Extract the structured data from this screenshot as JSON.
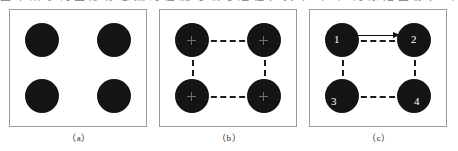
{
  "top_text_strip": {
    "cropped_line": "图 中 所 示 的 圆 形 标 志 点 的 检 测 与 编 号 过 程 ， 其 中 （ a ） 为 原 始 图 像 ， （ b ） 为 连 线 结 果 ， （ c ） 为 编 号 结 果"
  },
  "figure": {
    "panels": [
      {
        "id": "a",
        "caption": "（a）",
        "nodes": [
          {
            "position": "top-left",
            "label": ""
          },
          {
            "position": "top-right",
            "label": ""
          },
          {
            "position": "bottom-left",
            "label": ""
          },
          {
            "position": "bottom-right",
            "label": ""
          }
        ],
        "has_connectors": false,
        "has_center_marks": false,
        "has_arrow": false
      },
      {
        "id": "b",
        "caption": "（b）",
        "nodes": [
          {
            "position": "top-left",
            "label": ""
          },
          {
            "position": "top-right",
            "label": ""
          },
          {
            "position": "bottom-left",
            "label": ""
          },
          {
            "position": "bottom-right",
            "label": ""
          }
        ],
        "has_connectors": true,
        "has_center_marks": true,
        "has_arrow": false
      },
      {
        "id": "c",
        "caption": "（c）",
        "nodes": [
          {
            "position": "top-left",
            "label": "1"
          },
          {
            "position": "top-right",
            "label": "2"
          },
          {
            "position": "bottom-left",
            "label": "3"
          },
          {
            "position": "bottom-right",
            "label": "4"
          }
        ],
        "has_connectors": true,
        "has_center_marks": false,
        "has_arrow": true
      }
    ]
  },
  "colors": {
    "marker_fill": "#141414",
    "panel_border": "#9a9a9a",
    "connector": "#1a1a1a",
    "arrow": "#101010",
    "label_text": "#ffffff",
    "caption_text": "#2a2a2a",
    "background": "#ffffff"
  }
}
